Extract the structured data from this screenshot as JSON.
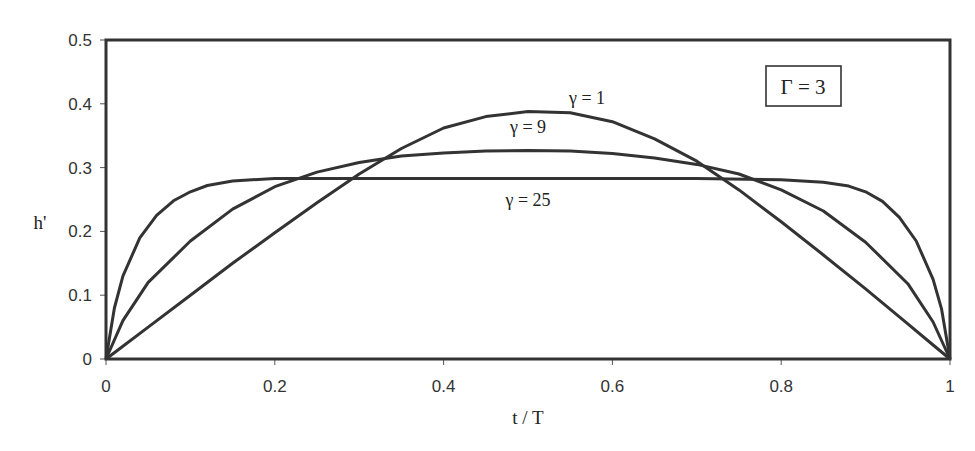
{
  "chart_data": {
    "type": "line",
    "title": "",
    "xlabel": "t / T",
    "ylabel": "h'",
    "xlim": [
      0,
      1
    ],
    "ylim": [
      0,
      0.5
    ],
    "xticks": [
      0,
      0.2,
      0.4,
      0.6,
      0.8,
      1
    ],
    "xtick_labels": [
      "0",
      "0.2",
      "0.4",
      "0.6",
      "0.8",
      "1"
    ],
    "yticks": [
      0,
      0.1,
      0.2,
      0.3,
      0.4,
      0.5
    ],
    "ytick_labels": [
      "0",
      "0.1",
      "0.2",
      "0.3",
      "0.4",
      "0.5"
    ],
    "grid": false,
    "annotation_box": "Γ = 3",
    "series": [
      {
        "name": "γ = 1",
        "label_pos": [
          0.57,
          0.4
        ],
        "x": [
          0,
          0.02,
          0.05,
          0.1,
          0.15,
          0.2,
          0.25,
          0.3,
          0.35,
          0.4,
          0.45,
          0.5,
          0.55,
          0.6,
          0.65,
          0.7,
          0.75,
          0.8,
          0.85,
          0.9,
          0.95,
          0.98,
          1
        ],
        "y": [
          0,
          0.02,
          0.05,
          0.1,
          0.15,
          0.198,
          0.245,
          0.29,
          0.33,
          0.362,
          0.38,
          0.388,
          0.386,
          0.372,
          0.345,
          0.31,
          0.265,
          0.215,
          0.163,
          0.11,
          0.055,
          0.022,
          0
        ]
      },
      {
        "name": "γ = 9",
        "label_pos": [
          0.5,
          0.355
        ],
        "x": [
          0,
          0.02,
          0.05,
          0.1,
          0.15,
          0.2,
          0.25,
          0.3,
          0.35,
          0.4,
          0.45,
          0.5,
          0.55,
          0.6,
          0.65,
          0.7,
          0.75,
          0.8,
          0.85,
          0.9,
          0.95,
          0.98,
          1
        ],
        "y": [
          0,
          0.06,
          0.12,
          0.185,
          0.235,
          0.27,
          0.293,
          0.308,
          0.318,
          0.323,
          0.326,
          0.327,
          0.326,
          0.322,
          0.315,
          0.305,
          0.29,
          0.265,
          0.232,
          0.183,
          0.118,
          0.058,
          0
        ]
      },
      {
        "name": "γ = 25",
        "label_pos": [
          0.5,
          0.24
        ],
        "x": [
          0,
          0.01,
          0.02,
          0.04,
          0.06,
          0.08,
          0.1,
          0.12,
          0.15,
          0.2,
          0.3,
          0.4,
          0.5,
          0.6,
          0.7,
          0.8,
          0.85,
          0.88,
          0.9,
          0.92,
          0.94,
          0.96,
          0.98,
          0.99,
          1
        ],
        "y": [
          0,
          0.08,
          0.13,
          0.19,
          0.225,
          0.248,
          0.262,
          0.272,
          0.279,
          0.283,
          0.283,
          0.283,
          0.283,
          0.283,
          0.283,
          0.281,
          0.277,
          0.271,
          0.262,
          0.247,
          0.222,
          0.185,
          0.125,
          0.078,
          0
        ]
      }
    ]
  },
  "page": {
    "top_clipped_text": "Fig. ... profile of ... effective ... for Γ = 3"
  }
}
